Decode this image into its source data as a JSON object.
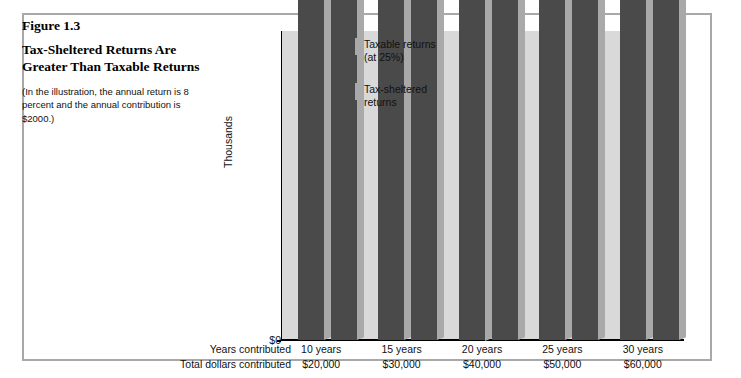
{
  "figure": {
    "number": "Figure 1.3",
    "title": "Tax-Sheltered Returns Are Greater Than Taxable Returns",
    "note": "(In the illustration, the annual return is 8 percent and the annual contribution is $2000.)"
  },
  "axis": {
    "ylabel": "Thousands",
    "yticks": [
      "$0",
      "$50",
      "$100",
      "$150",
      "$200",
      "$250"
    ],
    "row_label_years": "Years contributed",
    "row_label_dollars": "Total dollars contributed"
  },
  "legend": {
    "items": [
      {
        "label_line1": "Taxable returns",
        "label_line2": "(at 25%)",
        "color": "#4a4a4a"
      },
      {
        "label_line1": "Tax-sheltered",
        "label_line2": "returns",
        "color": "#4a4a4a"
      }
    ]
  },
  "chart_data": {
    "type": "bar",
    "title": "Tax-Sheltered Returns Are Greater Than Taxable Returns",
    "xlabel": "",
    "ylabel": "Thousands",
    "ylim": [
      0,
      270
    ],
    "ytick_values": [
      0,
      50000,
      100000,
      150000,
      200000,
      250000
    ],
    "ytick_labels": [
      "$0",
      "$50",
      "$100",
      "$150",
      "$200",
      "$250"
    ],
    "grid": "horizontal-white",
    "legend_position": "inside-top-left",
    "categories": [
      "10 years",
      "15 years",
      "20 years",
      "25 years",
      "30 years"
    ],
    "secondary_categories": [
      "$20,000",
      "$30,000",
      "$40,000",
      "$50,000",
      "$60,000"
    ],
    "series": [
      {
        "name": "Taxable returns (at 25%)",
        "color": "#4a4a4a",
        "values": [
          27943,
          49345,
          77985,
          116313,
          167603
        ],
        "labels": [
          "$27,943",
          "$49,345",
          "$77,985",
          "$116,313",
          "$167,603"
        ]
      },
      {
        "name": "Tax-sheltered returns",
        "color": "#4a4a4a",
        "values": [
          31920,
          58648,
          98846,
          157909,
          244691
        ],
        "labels": [
          "$31,920",
          "$58,648",
          "$98,846",
          "$157,909",
          "$244,691"
        ]
      }
    ]
  }
}
